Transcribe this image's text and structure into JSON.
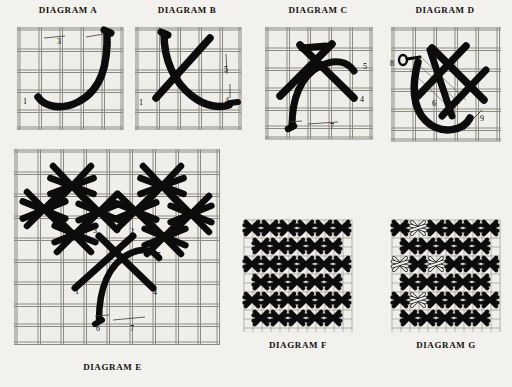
{
  "page": {
    "background_color": "#f2f1ee",
    "ink_color": "#000000",
    "grid_color": "#8d8a84",
    "canvas_fill": "#efeeea",
    "document_type": "needlepoint stitch instruction diagrams"
  },
  "panels": [
    {
      "id": "a",
      "title": "DIAGRAM A",
      "title_position": "top",
      "description": "single curved J stroke on canvas grid",
      "grid": {
        "cols": 5,
        "rows": 5
      },
      "numbers": [
        {
          "label": "1",
          "x": 10,
          "y": 73
        },
        {
          "label": "2",
          "x": 91,
          "y": 16
        },
        {
          "label": "3",
          "x": 43,
          "y": 13
        }
      ]
    },
    {
      "id": "b",
      "title": "DIAGRAM B",
      "title_position": "top",
      "description": "crossed diagonal stroke over curved J stroke",
      "grid": {
        "cols": 5,
        "rows": 5
      },
      "numbers": [
        {
          "label": "1",
          "x": 8,
          "y": 74
        },
        {
          "label": "2",
          "x": 66,
          "y": 12
        },
        {
          "label": "3",
          "x": 31,
          "y": 8
        },
        {
          "label": "4",
          "x": 90,
          "y": 72
        },
        {
          "label": "5",
          "x": 90,
          "y": 41
        }
      ]
    },
    {
      "id": "c",
      "title": "DIAGRAM C",
      "title_position": "top",
      "description": "double crossed stitches with curved stroke",
      "grid": {
        "cols": 5,
        "rows": 5
      },
      "numbers": [
        {
          "label": "4",
          "x": 94,
          "y": 70
        },
        {
          "label": "5",
          "x": 97,
          "y": 37
        },
        {
          "label": "6",
          "x": 22,
          "y": 98
        },
        {
          "label": "7",
          "x": 64,
          "y": 98
        }
      ]
    },
    {
      "id": "d",
      "title": "DIAGRAM D",
      "title_position": "top",
      "description": "completed woven cross unit with return stroke",
      "grid": {
        "cols": 5,
        "rows": 5
      },
      "numbers": [
        {
          "label": "6",
          "x": 42,
          "y": 74
        },
        {
          "label": "7",
          "x": 73,
          "y": 98
        },
        {
          "label": "8",
          "x": 5,
          "y": 34
        },
        {
          "label": "9",
          "x": 90,
          "y": 89
        }
      ]
    },
    {
      "id": "e",
      "title": "DIAGRAM E",
      "title_position": "bottom",
      "description": "partially worked field of woven cross units with working stitch",
      "grid": {
        "cols": 9,
        "rows": 9
      },
      "numbers": [
        {
          "label": "1",
          "x": 66,
          "y": 140
        },
        {
          "label": "2",
          "x": 121,
          "y": 82
        },
        {
          "label": "3",
          "x": 84,
          "y": 81
        },
        {
          "label": "4",
          "x": 142,
          "y": 141
        },
        {
          "label": "5",
          "x": 146,
          "y": 104
        },
        {
          "label": "6",
          "x": 83,
          "y": 177
        },
        {
          "label": "7",
          "x": 117,
          "y": 177
        }
      ]
    },
    {
      "id": "f",
      "title": "DIAGRAM F",
      "title_position": "bottom",
      "description": "completed all-over pattern of woven cross stitches",
      "grid": {
        "cols": 12,
        "rows": 12
      },
      "numbers": []
    },
    {
      "id": "g",
      "title": "DIAGRAM G",
      "title_position": "bottom",
      "description": "completed pattern with contrasting light accent crosses",
      "grid": {
        "cols": 12,
        "rows": 12
      },
      "numbers": []
    }
  ]
}
